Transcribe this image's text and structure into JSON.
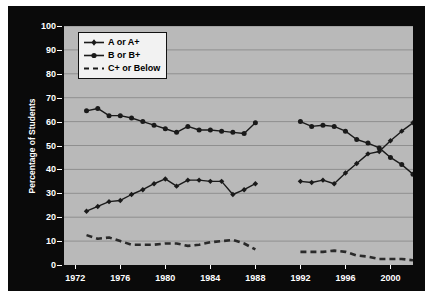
{
  "chart_data": {
    "type": "line",
    "title": "",
    "xlabel": "",
    "ylabel": "Percentage of Students",
    "xlim": [
      1971,
      2002
    ],
    "ylim": [
      0,
      100
    ],
    "grid": true,
    "legend_position": "top-left",
    "xticks": [
      1972,
      1976,
      1980,
      1984,
      1988,
      1992,
      1996,
      2000
    ],
    "yticks": [
      0,
      10,
      20,
      30,
      40,
      50,
      60,
      70,
      80,
      90,
      100
    ],
    "note": "Data has a gap between 1988 and 1992; all three series are split into two segments.",
    "series": [
      {
        "name": "A or A+",
        "marker": "diamond",
        "linestyle": "solid",
        "color": "#1a1a1a",
        "segments": [
          {
            "x": [
              1973,
              1974,
              1975,
              1976,
              1977,
              1978,
              1979,
              1980,
              1981,
              1982,
              1983,
              1984,
              1985,
              1986,
              1987,
              1988
            ],
            "y": [
              22.5,
              24.5,
              26.5,
              27.0,
              29.5,
              31.5,
              34.0,
              36.0,
              33.0,
              35.5,
              35.5,
              35.0,
              35.0,
              29.5,
              31.5,
              34.0
            ]
          },
          {
            "x": [
              1992,
              1993,
              1994,
              1995,
              1996,
              1997,
              1998,
              1999,
              2000,
              2001,
              2002
            ],
            "y": [
              35.0,
              34.5,
              35.5,
              34.0,
              38.5,
              42.5,
              46.5,
              47.5,
              52.0,
              56.0,
              59.5
            ]
          }
        ]
      },
      {
        "name": "B or B+",
        "marker": "circle",
        "linestyle": "solid",
        "color": "#1a1a1a",
        "segments": [
          {
            "x": [
              1973,
              1974,
              1975,
              1976,
              1977,
              1978,
              1979,
              1980,
              1981,
              1982,
              1983,
              1984,
              1985,
              1986,
              1987,
              1988
            ],
            "y": [
              64.5,
              65.5,
              62.5,
              62.5,
              61.5,
              60.0,
              58.5,
              57.0,
              55.5,
              58.0,
              56.5,
              56.5,
              56.0,
              55.5,
              55.0,
              59.5
            ]
          },
          {
            "x": [
              1992,
              1993,
              1994,
              1995,
              1996,
              1997,
              1998,
              1999,
              2000,
              2001,
              2002
            ],
            "y": [
              60.0,
              58.0,
              58.5,
              58.0,
              56.0,
              52.5,
              51.0,
              49.0,
              45.0,
              42.0,
              38.0
            ]
          }
        ]
      },
      {
        "name": "C+ or Below",
        "marker": "none",
        "linestyle": "dashed",
        "color": "#2a2a2a",
        "segments": [
          {
            "x": [
              1973,
              1974,
              1975,
              1976,
              1977,
              1978,
              1979,
              1980,
              1981,
              1982,
              1983,
              1984,
              1985,
              1986,
              1987,
              1988
            ],
            "y": [
              12.5,
              11.0,
              11.5,
              10.0,
              8.5,
              8.5,
              8.5,
              9.0,
              9.0,
              8.0,
              8.5,
              9.5,
              10.0,
              10.5,
              9.0,
              6.5
            ]
          },
          {
            "x": [
              1992,
              1993,
              1994,
              1995,
              1996,
              1997,
              1998,
              1999,
              2000,
              2001,
              2002
            ],
            "y": [
              5.5,
              5.5,
              5.5,
              6.0,
              5.5,
              4.0,
              3.5,
              2.5,
              2.5,
              2.5,
              2.0
            ]
          }
        ]
      }
    ]
  },
  "legend": {
    "items": [
      {
        "label": "A or A+",
        "symbol": "line-diamond"
      },
      {
        "label": "B or B+",
        "symbol": "line-circle"
      },
      {
        "label": "C+ or Below",
        "symbol": "line-dashed"
      }
    ]
  },
  "colors": {
    "frame": "#0a0a0a",
    "plot_background": "#b9b9b9",
    "gridline": "#8f8f8f",
    "axis_text": "#ffffff",
    "series": "#1a1a1a",
    "legend_background": "#f2f2f2"
  }
}
